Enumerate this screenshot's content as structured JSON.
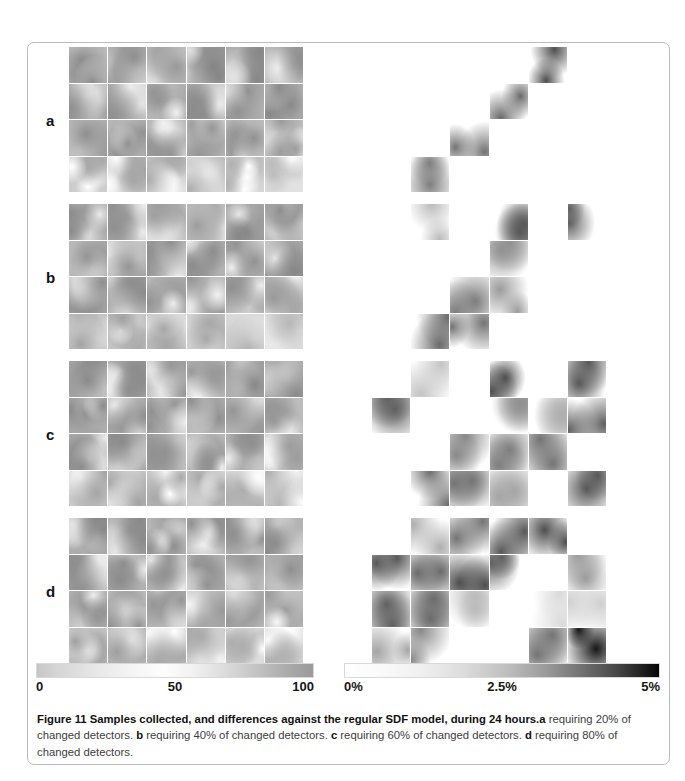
{
  "figure": {
    "number": "Figure 11",
    "title_bold": "Figure 11 Samples collected, and differences against the regular SDF model, during 24 hours.",
    "caption_parts": {
      "lead_bold": "Figure 11 Samples collected, and differences against the regular SDF model, during 24 hours.",
      "a_label": "a",
      "a_text": " requiring 20% of changed detectors. ",
      "b_label": "b",
      "b_text": " requiring 40% of changed detectors. ",
      "c_label": "c",
      "c_text": " requiring 60% of changed detectors. ",
      "d_label": "d",
      "d_text": " requiring 80% of changed detectors."
    }
  },
  "panels": [
    {
      "label": "a",
      "requirement": "requiring 20% of changed detectors"
    },
    {
      "label": "b",
      "requirement": "requiring 40% of changed detectors"
    },
    {
      "label": "c",
      "requirement": "requiring 60% of changed detectors"
    },
    {
      "label": "d",
      "requirement": "requiring 80% of changed detectors"
    }
  ],
  "grid": {
    "columns": 6,
    "rows": 4,
    "total_tiles": 24
  },
  "colorbars": {
    "samples": {
      "name": "samples-colorbar",
      "min_label": "0",
      "mid_label": "50",
      "max_label": "100",
      "min_value": 0,
      "mid_value": 50,
      "max_value": 100,
      "unit": "count",
      "start_color": "#c6c6c6",
      "end_color": "#9a9a9a"
    },
    "differences": {
      "name": "differences-colorbar",
      "min_label": "0%",
      "mid_label": "2.5%",
      "max_label": "5%",
      "min_value": 0,
      "mid_value": 2.5,
      "max_value": 5,
      "unit": "%",
      "start_color": "#ffffff",
      "end_color": "#050505"
    }
  },
  "chart_data": {
    "type": "heatmap",
    "title": "Samples collected, and differences against the regular SDF model, during 24 hours",
    "xlabel": "",
    "ylabel": "",
    "grid": true,
    "legend_position": "bottom",
    "panel_grid": {
      "rows": 4,
      "cols": 6
    },
    "left_colorbar_range": [
      0,
      100
    ],
    "right_colorbar_range": [
      0,
      5
    ],
    "panels": [
      {
        "label": "a",
        "requirement_pct": 20,
        "samples_intensity": [
          [
            62,
            60,
            52,
            68,
            66,
            58
          ],
          [
            58,
            60,
            56,
            62,
            58,
            64
          ],
          [
            60,
            58,
            56,
            54,
            58,
            50
          ],
          [
            40,
            42,
            38,
            36,
            34,
            24
          ]
        ],
        "differences_pct": [
          [
            0.0,
            0.0,
            0.0,
            0.0,
            3.4,
            0.0
          ],
          [
            0.0,
            0.0,
            0.0,
            2.8,
            0.0,
            0.0
          ],
          [
            0.0,
            0.0,
            2.6,
            0.0,
            0.0,
            0.0
          ],
          [
            0.0,
            2.4,
            0.0,
            0.0,
            0.0,
            0.0
          ]
        ]
      },
      {
        "label": "b",
        "requirement_pct": 40,
        "samples_intensity": [
          [
            62,
            60,
            48,
            50,
            66,
            62
          ],
          [
            56,
            54,
            60,
            62,
            58,
            66
          ],
          [
            60,
            62,
            58,
            56,
            60,
            52
          ],
          [
            44,
            46,
            42,
            40,
            30,
            28
          ]
        ],
        "differences_pct": [
          [
            0.0,
            1.2,
            0.0,
            3.2,
            0.0,
            3.0
          ],
          [
            0.0,
            0.0,
            0.0,
            2.0,
            0.0,
            0.0
          ],
          [
            0.0,
            0.0,
            2.4,
            1.8,
            0.0,
            0.0
          ],
          [
            0.0,
            2.8,
            2.6,
            0.0,
            0.0,
            0.0
          ]
        ]
      },
      {
        "label": "c",
        "requirement_pct": 60,
        "samples_intensity": [
          [
            64,
            62,
            54,
            52,
            66,
            64
          ],
          [
            62,
            60,
            58,
            60,
            56,
            54
          ],
          [
            62,
            64,
            60,
            58,
            60,
            48
          ],
          [
            42,
            44,
            40,
            40,
            36,
            34
          ]
        ],
        "differences_pct": [
          [
            0.0,
            1.0,
            0.0,
            3.4,
            0.0,
            3.2
          ],
          [
            3.0,
            0.0,
            0.0,
            2.0,
            1.4,
            3.0
          ],
          [
            0.0,
            0.0,
            2.2,
            2.4,
            2.6,
            0.0
          ],
          [
            0.0,
            2.8,
            2.6,
            1.6,
            0.0,
            3.2
          ]
        ]
      },
      {
        "label": "d",
        "requirement_pct": 80,
        "samples_intensity": [
          [
            66,
            64,
            60,
            58,
            60,
            62
          ],
          [
            60,
            62,
            58,
            58,
            56,
            60
          ],
          [
            56,
            58,
            54,
            52,
            54,
            50
          ],
          [
            46,
            48,
            40,
            38,
            36,
            32
          ]
        ],
        "differences_pct": [
          [
            0.0,
            1.4,
            2.6,
            3.2,
            3.4,
            0.0
          ],
          [
            3.2,
            2.8,
            3.4,
            3.0,
            0.0,
            1.8
          ],
          [
            3.0,
            2.8,
            1.2,
            0.0,
            0.6,
            0.8
          ],
          [
            1.6,
            2.2,
            0.0,
            0.0,
            2.6,
            4.6
          ]
        ]
      }
    ]
  }
}
